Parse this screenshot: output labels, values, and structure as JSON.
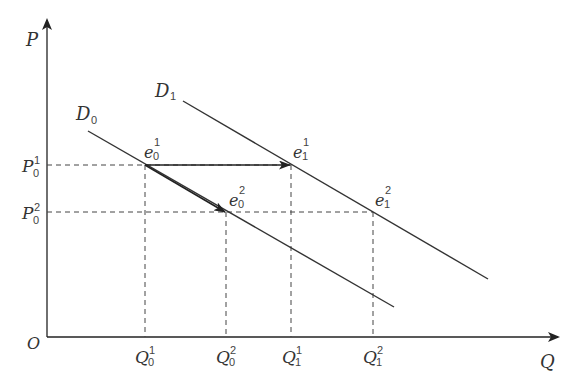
{
  "diagram": {
    "type": "economics-demand-shift",
    "colors": {
      "line": "#333333",
      "axis": "#222222",
      "dash": "#444444",
      "background": "#ffffff"
    },
    "axes": {
      "origin_label": "O",
      "y_label": "P",
      "x_label": "Q"
    },
    "curves": [
      {
        "id": "D0",
        "label_main": "D",
        "label_sub": "0"
      },
      {
        "id": "D1",
        "label_main": "D",
        "label_sub": "1"
      }
    ],
    "price_levels": [
      {
        "main": "P",
        "sub": "0",
        "sup": "1"
      },
      {
        "main": "P",
        "sub": "0",
        "sup": "2"
      }
    ],
    "quantities": [
      {
        "main": "Q",
        "sub": "0",
        "sup": "1"
      },
      {
        "main": "Q",
        "sub": "0",
        "sup": "2"
      },
      {
        "main": "Q",
        "sub": "1",
        "sup": "1"
      },
      {
        "main": "Q",
        "sub": "1",
        "sup": "2"
      }
    ],
    "equilibria": [
      {
        "main": "e",
        "sub": "0",
        "sup": "1"
      },
      {
        "main": "e",
        "sub": "1",
        "sup": "1"
      },
      {
        "main": "e",
        "sub": "0",
        "sup": "2"
      },
      {
        "main": "e",
        "sub": "1",
        "sup": "2"
      }
    ],
    "arrows": [
      {
        "from": "e0^1",
        "to": "e1^1",
        "description": "horizontal arrow along P0^1"
      },
      {
        "from": "e0^1",
        "to": "e0^2",
        "description": "movement along D0"
      }
    ]
  }
}
